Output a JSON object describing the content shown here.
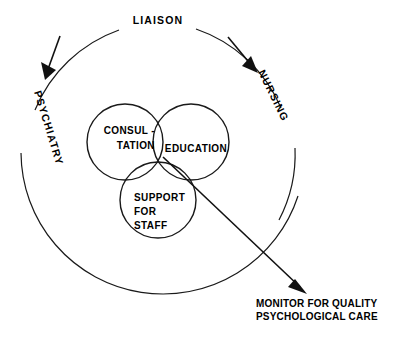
{
  "diagram": {
    "title": "LIAISON",
    "outer_ring": {
      "top_label": "LIAISON",
      "left_label": "PSYCHIATRY",
      "right_label": "NURSING"
    },
    "venn": {
      "circles": [
        {
          "id": "consultation",
          "line1": "CONSUL -",
          "line2": "TATION"
        },
        {
          "id": "education",
          "line1": "EDUCATION"
        },
        {
          "id": "support",
          "line1": "SUPPORT",
          "line2": "FOR",
          "line3": "STAFF"
        }
      ]
    },
    "outcome": {
      "line1": "MONITOR FOR QUALITY",
      "line2": "PSYCHOLOGICAL CARE"
    },
    "colors": {
      "stroke": "#1a1a1a",
      "text": "#000000",
      "background": "#ffffff"
    }
  }
}
